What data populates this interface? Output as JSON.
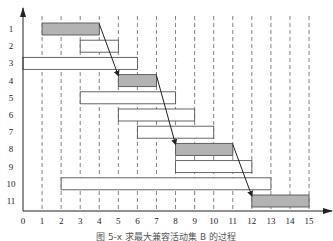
{
  "chart_data": {
    "type": "gantt",
    "title": "",
    "caption": "图 5-x 求最大兼容活动集 B 的过程",
    "xlabel": "",
    "ylabel": "",
    "xlim": [
      0,
      15
    ],
    "x_ticks": [
      0,
      1,
      2,
      3,
      4,
      5,
      6,
      7,
      8,
      9,
      10,
      11,
      12,
      13,
      14,
      15
    ],
    "y_ticks": [
      1,
      2,
      3,
      4,
      5,
      6,
      7,
      8,
      9,
      10,
      11
    ],
    "grid": "vertical dashed at each integer x from 1 to 15",
    "activities": [
      {
        "id": 1,
        "start": 1,
        "end": 4,
        "selected": true
      },
      {
        "id": 2,
        "start": 3,
        "end": 5,
        "selected": false
      },
      {
        "id": 3,
        "start": 0,
        "end": 6,
        "selected": false
      },
      {
        "id": 4,
        "start": 5,
        "end": 7,
        "selected": true
      },
      {
        "id": 5,
        "start": 3,
        "end": 8,
        "selected": false
      },
      {
        "id": 6,
        "start": 5,
        "end": 9,
        "selected": false
      },
      {
        "id": 7,
        "start": 6,
        "end": 10,
        "selected": false
      },
      {
        "id": 8,
        "start": 8,
        "end": 11,
        "selected": true
      },
      {
        "id": 9,
        "start": 8,
        "end": 12,
        "selected": false
      },
      {
        "id": 10,
        "start": 2,
        "end": 13,
        "selected": false
      },
      {
        "id": 11,
        "start": 12,
        "end": 15,
        "selected": true
      }
    ],
    "arrows": [
      {
        "from": 1,
        "to": 4
      },
      {
        "from": 4,
        "to": 8
      },
      {
        "from": 8,
        "to": 11
      }
    ],
    "colors": {
      "selected_fill": "#b3b3b3",
      "unselected_fill": "#ffffff",
      "bar_stroke": "#555555",
      "grid": "#666666",
      "axis": "#222222"
    }
  }
}
